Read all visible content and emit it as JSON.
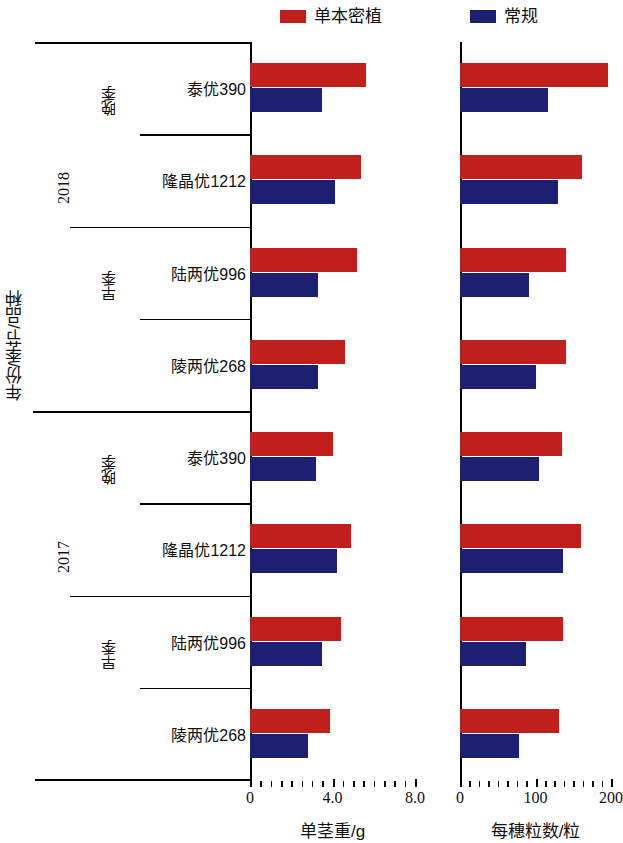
{
  "legend": {
    "items": [
      {
        "label": "单本密植",
        "color": "#c0201c",
        "name": "legend-dense-planting"
      },
      {
        "label": "常规",
        "color": "#1d1f72",
        "name": "legend-conventional"
      }
    ]
  },
  "axes": {
    "y_title": "年份/季节/品种",
    "left": {
      "x_title": "单茎重/g",
      "ticks": [
        "0",
        "4.0",
        "8.0"
      ],
      "tick_values": [
        0,
        4,
        8
      ],
      "range": [
        0,
        8
      ]
    },
    "right": {
      "x_title": "每穗粒数/粒",
      "ticks": [
        "0",
        "100",
        "200"
      ],
      "tick_values": [
        0,
        100,
        200
      ],
      "range": [
        0,
        200
      ]
    }
  },
  "groups": [
    {
      "year": "2018",
      "seasons": [
        {
          "season": "晚季",
          "varieties": [
            "泰优390",
            "隆晶优1212"
          ]
        },
        {
          "season": "早季",
          "varieties": [
            "陆两优996",
            "陵两优268"
          ]
        }
      ]
    },
    {
      "year": "2017",
      "seasons": [
        {
          "season": "晚季",
          "varieties": [
            "泰优390",
            "隆晶优1212"
          ]
        },
        {
          "season": "早季",
          "varieties": [
            "陆两优996",
            "陵两优268"
          ]
        }
      ]
    }
  ],
  "chart_data": [
    {
      "type": "bar",
      "orientation": "horizontal",
      "title": "",
      "xlabel": "单茎重/g",
      "ylabel": "年份/季节/品种",
      "xlim": [
        0,
        8
      ],
      "grid": false,
      "legend_position": "top",
      "categories": [
        "2018 晚季 泰优390",
        "2018 晚季 隆晶优1212",
        "2018 早季 陆两优996",
        "2018 早季 陵两优268",
        "2017 晚季 泰优390",
        "2017 晚季 隆晶优1212",
        "2017 早季 陆两优996",
        "2017 早季 陵两优268"
      ],
      "series": [
        {
          "name": "单本密植",
          "color": "#c0201c",
          "values": [
            5.6,
            5.4,
            5.2,
            4.6,
            4.0,
            4.9,
            4.4,
            3.9
          ]
        },
        {
          "name": "常规",
          "color": "#1d1f72",
          "values": [
            3.5,
            4.1,
            3.3,
            3.3,
            3.2,
            4.2,
            3.5,
            2.8
          ]
        }
      ]
    },
    {
      "type": "bar",
      "orientation": "horizontal",
      "title": "",
      "xlabel": "每穗粒数/粒",
      "ylabel": "年份/季节/品种",
      "xlim": [
        0,
        200
      ],
      "grid": false,
      "legend_position": "top",
      "categories": [
        "2018 晚季 泰优390",
        "2018 晚季 隆晶优1212",
        "2018 早季 陆两优996",
        "2018 早季 陵两优268",
        "2017 晚季 泰优390",
        "2017 晚季 隆晶优1212",
        "2017 早季 陆两优996",
        "2017 早季 陵两优268"
      ],
      "series": [
        {
          "name": "单本密植",
          "color": "#c0201c",
          "values": [
            196,
            161,
            140,
            140,
            135,
            160,
            136,
            131
          ]
        },
        {
          "name": "常规",
          "color": "#1d1f72",
          "values": [
            116,
            130,
            91,
            100,
            104,
            136,
            87,
            78
          ]
        }
      ]
    }
  ]
}
